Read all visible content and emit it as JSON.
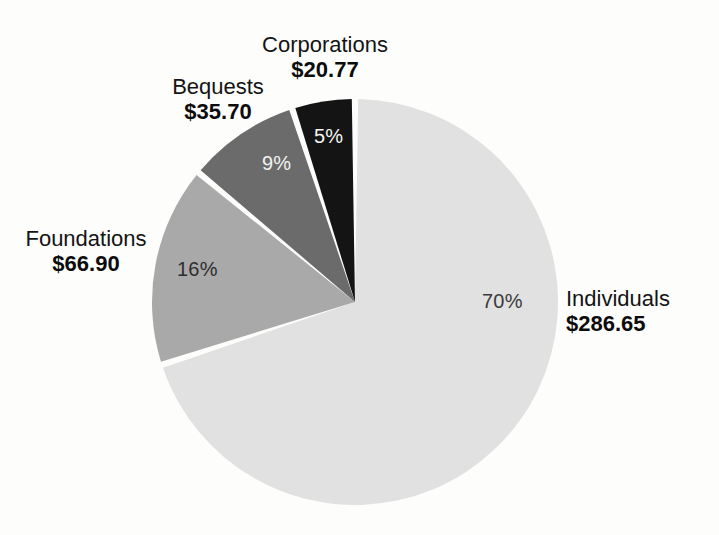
{
  "figure": {
    "background_color": "#fdfdfc",
    "kind": "pie-chart"
  },
  "chart_data": {
    "type": "pie",
    "title": "",
    "categories": [
      "Individuals",
      "Foundations",
      "Bequests",
      "Corporations"
    ],
    "values": [
      286.65,
      66.9,
      35.7,
      20.77
    ],
    "percent_labels": [
      "70%",
      "16%",
      "9%",
      "5%"
    ],
    "percents": [
      70,
      16,
      9,
      5
    ],
    "amount_labels": [
      "$286.65",
      "$66.90",
      "$35.70",
      "$20.77"
    ],
    "colors": [
      "#e1e1e1",
      "#a9a9a9",
      "#6b6b6b",
      "#141414"
    ],
    "start_angle_deg": 0,
    "direction": "clockwise",
    "slice_gap": true,
    "legend": "none",
    "grid": false,
    "xlabel": "",
    "ylabel": "",
    "slices": [
      {
        "name": "Individuals",
        "percent_label": "70%",
        "amount_label": "$286.65",
        "value": 286.65,
        "percent": 70,
        "color": "#e1e1e1",
        "percent_text_color": "#3a3a3a"
      },
      {
        "name": "Foundations",
        "percent_label": "16%",
        "amount_label": "$66.90",
        "value": 66.9,
        "percent": 16,
        "color": "#a9a9a9",
        "percent_text_color": "#2e2e2e"
      },
      {
        "name": "Bequests",
        "percent_label": "9%",
        "amount_label": "$35.70",
        "value": 35.7,
        "percent": 9,
        "color": "#6b6b6b",
        "percent_text_color": "#f2f2f2"
      },
      {
        "name": "Corporations",
        "percent_label": "5%",
        "amount_label": "$20.77",
        "value": 20.77,
        "percent": 5,
        "color": "#141414",
        "percent_text_color": "#f4f4f4"
      }
    ]
  }
}
